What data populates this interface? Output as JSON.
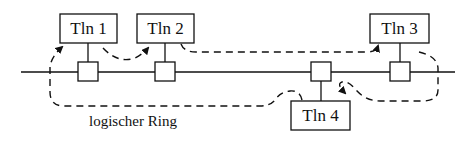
{
  "diagram": {
    "nodes": [
      {
        "id": "tln1",
        "label": "Tln 1"
      },
      {
        "id": "tln2",
        "label": "Tln 2"
      },
      {
        "id": "tln3",
        "label": "Tln 3"
      },
      {
        "id": "tln4",
        "label": "Tln 4"
      }
    ],
    "ring_label": "logischer Ring",
    "ring_order": [
      "Tln 1",
      "Tln 2",
      "Tln 3",
      "Tln 4",
      "Tln 1"
    ],
    "colors": {
      "stroke": "#111111",
      "background": "#ffffff"
    }
  }
}
